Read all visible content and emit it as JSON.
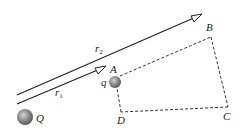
{
  "diagram": {
    "type": "electrostatics-path-diagram",
    "labels": {
      "r1": "r",
      "r1_sub": "1",
      "r2": "r",
      "r2_sub": "2",
      "A": "A",
      "B": "B",
      "C": "C",
      "D": "D",
      "q": "q",
      "Q": "Q"
    },
    "charges": [
      {
        "name": "Q",
        "role": "source charge"
      },
      {
        "name": "q",
        "role": "test charge at A"
      }
    ],
    "path": [
      "A",
      "B",
      "C",
      "D",
      "A"
    ],
    "vectors": [
      {
        "name": "r1",
        "from": "Q",
        "to": "A"
      },
      {
        "name": "r2",
        "from": "Q",
        "to": "B"
      }
    ],
    "colors": {
      "line": "#222222",
      "dashed": "#333333",
      "charge": "#7a7a7a"
    }
  }
}
